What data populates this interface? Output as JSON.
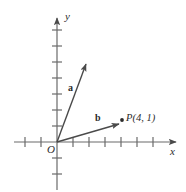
{
  "figure": {
    "background_color": "#ffffff",
    "stroke_color": "#555555",
    "text_color": "#2b2b2b"
  },
  "axes": {
    "x_label": "x",
    "y_label": "y",
    "origin_label": "O",
    "unit_px": 16,
    "origin_px": {
      "x": 57,
      "y": 142
    },
    "x_range_units": [
      -2.7,
      7.6
    ],
    "y_range_units": [
      -3.0,
      7.9
    ],
    "x_ticks_units": [
      -2,
      -1,
      1,
      2,
      3,
      4,
      5,
      6
    ],
    "y_ticks_units": [
      -3,
      -2,
      1,
      2,
      3,
      4,
      5,
      6,
      7
    ]
  },
  "vectors": [
    {
      "name": "a",
      "label": "a",
      "from_units": {
        "x": 0,
        "y": 0
      },
      "to_units": {
        "x": 1.8,
        "y": 4.9
      },
      "label_pos_px": {
        "x": 68,
        "y": 83
      }
    },
    {
      "name": "b",
      "label": "b",
      "from_units": {
        "x": 0,
        "y": 0
      },
      "to_units": {
        "x": 3.9,
        "y": 1.1
      },
      "label_pos_px": {
        "x": 95,
        "y": 113
      }
    }
  ],
  "points": [
    {
      "name": "P",
      "label": "P(4, 1)",
      "coords_units": {
        "x": 4,
        "y": 1
      },
      "dot_px": {
        "x": 122,
        "y": 120
      }
    }
  ]
}
